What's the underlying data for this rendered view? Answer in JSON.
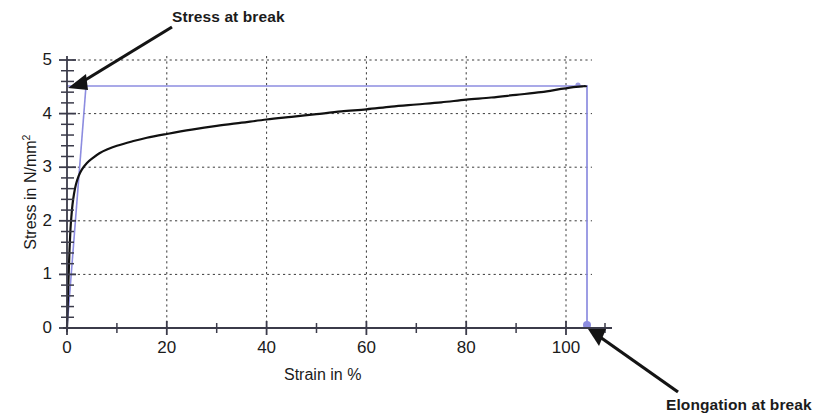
{
  "chart_data": {
    "type": "line",
    "title": "",
    "xlabel": "Strain in %",
    "ylabel": "Stress in N/mm²",
    "xlim": [
      0,
      112
    ],
    "ylim": [
      0,
      5.2
    ],
    "xticks": [
      0,
      20,
      40,
      60,
      80,
      100
    ],
    "xticklabels": [
      "0",
      "20",
      "40",
      "60",
      "80",
      "100"
    ],
    "xminorticks": [
      10,
      30,
      50,
      70,
      90,
      110
    ],
    "yticks": [
      0,
      1,
      2,
      3,
      4,
      5
    ],
    "yticklabels": [
      "0",
      "1",
      "2",
      "3",
      "4",
      "5"
    ],
    "yminortick_step": 0.2,
    "grid": true,
    "grid_style": "dotted",
    "legend": "none",
    "series": [
      {
        "name": "stress-strain curve",
        "color": "#111111",
        "x": [
          0,
          0.15,
          0.3,
          0.5,
          0.7,
          0.9,
          1.1,
          1.4,
          1.8,
          2.3,
          3.0,
          4.0,
          5.0,
          6.5,
          8.0,
          10.0,
          13.0,
          16.0,
          20.0,
          25.0,
          30.0,
          35.0,
          40.0,
          45.0,
          50.0,
          55.0,
          60.0,
          65.0,
          70.0,
          75.0,
          80.0,
          85.0,
          90.0,
          95.0,
          99.0,
          102.0,
          103.5,
          104.0
        ],
        "y": [
          0,
          0.45,
          0.9,
          1.45,
          1.85,
          2.1,
          2.3,
          2.5,
          2.68,
          2.83,
          2.96,
          3.08,
          3.16,
          3.26,
          3.33,
          3.4,
          3.48,
          3.55,
          3.62,
          3.7,
          3.77,
          3.83,
          3.89,
          3.94,
          3.99,
          4.04,
          4.08,
          4.13,
          4.17,
          4.21,
          4.26,
          4.3,
          4.35,
          4.4,
          4.46,
          4.5,
          4.51,
          4.51
        ]
      }
    ],
    "annotations": {
      "stress_at_break": {
        "label": "Stress at break",
        "value": 4.5,
        "unit": "N/mm²",
        "marker": "horizontal-line-at-y",
        "color": "#8c8ce0"
      },
      "elongation_at_break": {
        "label": "Elongation at break",
        "value": 104,
        "unit": "%",
        "marker": "vertical-line-at-x",
        "color": "#8c8ce0"
      },
      "modulus_tangent": {
        "label": "",
        "color": "#8c8ce0",
        "from": [
          0,
          0
        ],
        "to": [
          3.8,
          4.51
        ]
      }
    }
  },
  "labels": {
    "stress_at_break": "Stress at break",
    "elongation_at_break": "Elongation at break"
  },
  "axes": {
    "x_title": "Strain in %",
    "y_title_prefix": "Stress in N/mm",
    "y_title_sup": "2",
    "x_ticks": [
      "0",
      "20",
      "40",
      "60",
      "80",
      "100"
    ],
    "y_ticks": [
      "5",
      "4",
      "3",
      "2",
      "1",
      "0"
    ]
  },
  "colors": {
    "curve": "#111111",
    "annotation": "#8c8ce0",
    "grid": "#3a3a3a",
    "axis": "#3b3b4a",
    "text": "#1b1b1b",
    "background": "#ffffff"
  }
}
